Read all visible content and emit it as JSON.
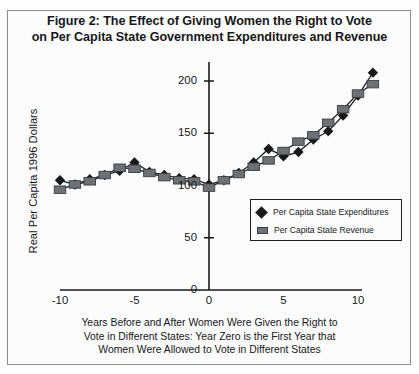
{
  "figure": {
    "title_lines": [
      "Figure 2: The Effect of Giving Women the Right to Vote",
      "on Per Capita State Government Expenditures and Revenue"
    ],
    "caption_lines": [
      "Years Before and After Women Were Given the Right to",
      "Vote in Different States: Year Zero is the First Year that",
      "Women Were Allowed to Vote in Different States"
    ],
    "border_color": "#8d8d8d",
    "background_color": "#fcfcfc"
  },
  "legend": {
    "entries": [
      {
        "label": "Per Capita State Expenditures",
        "marker": "diamond",
        "color": "#16181a"
      },
      {
        "label": "Per Capita State Revenue",
        "marker": "square",
        "color": "#6e7174"
      }
    ]
  },
  "axes": {
    "y_title": "Real Per Capita 1996 Dollars",
    "y_ticks": [
      {
        "value": 200,
        "label": "200"
      },
      {
        "value": 150,
        "label": "150"
      },
      {
        "value": 100,
        "label": "100"
      },
      {
        "value": 50,
        "label": "50"
      },
      {
        "value": 0,
        "label": "0"
      }
    ],
    "x_ticks": [
      {
        "value": -10,
        "label": "-10"
      },
      {
        "value": -5,
        "label": "-5"
      },
      {
        "value": 0,
        "label": "0"
      },
      {
        "value": 5,
        "label": "5"
      },
      {
        "value": 10,
        "label": "10"
      }
    ]
  },
  "chart_data": {
    "type": "line",
    "title": "Figure 2: The Effect of Giving Women the Right to Vote on Per Capita State Government Expenditures and Revenue",
    "xlabel": "Years Before and After Women Were Given the Right to Vote in Different States: Year Zero is the First Year that Women Were Allowed to Vote in Different States",
    "ylabel": "Real Per Capita 1996 Dollars",
    "xlim": [
      -11,
      11
    ],
    "ylim": [
      0,
      215
    ],
    "grid": false,
    "legend_position": "inside-right",
    "x": [
      -10,
      -9,
      -8,
      -7,
      -6,
      -5,
      -4,
      -3,
      -2,
      -1,
      0,
      1,
      2,
      3,
      4,
      5,
      6,
      7,
      8,
      9,
      10,
      11
    ],
    "series": [
      {
        "name": "Per Capita State Expenditures",
        "marker": "diamond",
        "color": "#16181a",
        "values": [
          105,
          101,
          106,
          110,
          114,
          122,
          113,
          110,
          107,
          106,
          101,
          105,
          112,
          122,
          135,
          128,
          132,
          144,
          152,
          167,
          186,
          208
        ]
      },
      {
        "name": "Per Capita State Revenue",
        "marker": "square",
        "color": "#6e7174",
        "values": [
          96,
          101,
          104,
          110,
          117,
          116,
          112,
          108,
          105,
          104,
          98,
          105,
          111,
          118,
          124,
          133,
          142,
          148,
          160,
          173,
          188,
          197
        ]
      }
    ]
  }
}
